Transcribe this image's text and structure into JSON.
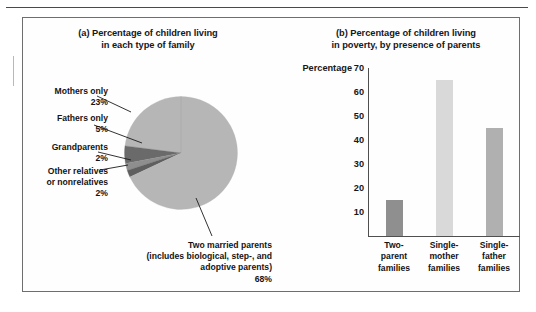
{
  "figure": {
    "panel_a_title": "(a) Percentage of children living in each type of family",
    "panel_a_title_line1": "(a) Percentage of children living",
    "panel_a_title_line2": "in each type of family",
    "panel_b_title_line1": "(b) Percentage of children living",
    "panel_b_title_line2": "in poverty, by presence of parents",
    "border_color": "#6e6e6e"
  },
  "chart_data": [
    {
      "type": "pie",
      "title": "(a) Percentage of children living in each type of family",
      "labels": [
        "Mothers only",
        "Fathers only",
        "Grandparents",
        "Other relatives or nonrelatives",
        "Two married parents (includes biological, step-, and adoptive parents)"
      ],
      "values": [
        23,
        5,
        2,
        2,
        68
      ],
      "value_labels": [
        "23%",
        "5%",
        "2%",
        "2%",
        "68%"
      ],
      "colors": [
        "#b6b6b6",
        "#6a6a6a",
        "#8e8e8e",
        "#5f5f5f",
        "#b6b6b6"
      ],
      "start_angle_oclock": 12,
      "direction": "counterclockwise",
      "legend": "callout-labels",
      "slice_label_lines": {
        "mothers": [
          "Mothers only",
          "23%"
        ],
        "fathers": [
          "Fathers only",
          "5%"
        ],
        "grandparents": [
          "Grandparents",
          "2%"
        ],
        "other": [
          "Other relatives",
          "or nonrelatives",
          "2%"
        ],
        "married": [
          "Two married parents",
          "(includes biological, step-, and",
          "adoptive parents)",
          "68%"
        ]
      }
    },
    {
      "type": "bar",
      "title": "(b) Percentage of children living in poverty, by presence of parents",
      "ylabel": "Percentage",
      "xlabel": "",
      "categories": [
        "Two-parent families",
        "Single-mother families",
        "Single-father families"
      ],
      "category_lines": [
        [
          "Two-",
          "parent",
          "families"
        ],
        [
          "Single-",
          "mother",
          "families"
        ],
        [
          "Single-",
          "father",
          "families"
        ]
      ],
      "values": [
        15,
        65,
        45
      ],
      "colors": [
        "#8f8f8f",
        "#d9d9d9",
        "#b0b0b0"
      ],
      "ylim": [
        0,
        70
      ],
      "yticks": [
        10,
        20,
        30,
        40,
        50,
        60,
        70
      ],
      "ytick_labels": [
        "10",
        "20",
        "30",
        "40",
        "50",
        "60",
        "70"
      ],
      "grid": false,
      "legend": "none"
    }
  ]
}
